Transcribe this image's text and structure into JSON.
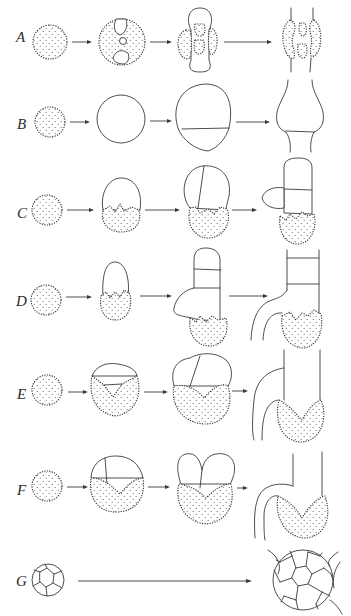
{
  "figure": {
    "type": "scientific-diagram",
    "rows": [
      {
        "label": "A",
        "stages": 4
      },
      {
        "label": "B",
        "stages": 4
      },
      {
        "label": "C",
        "stages": 4
      },
      {
        "label": "D",
        "stages": 4
      },
      {
        "label": "E",
        "stages": 4
      },
      {
        "label": "F",
        "stages": 4
      },
      {
        "label": "G",
        "stages": 2
      }
    ],
    "colors": {
      "line": "#3a3a3a",
      "background": "#ffffff",
      "stipple": "#555555"
    }
  }
}
